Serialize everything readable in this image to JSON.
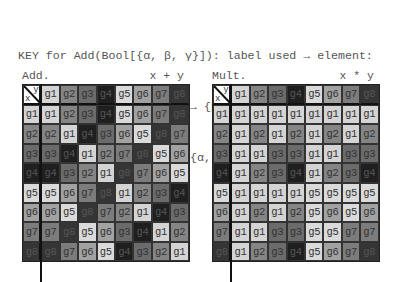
{
  "key": {
    "line1": "KEY for Add(Bool[{α, β, γ}]): label used → element:",
    "line2": "{g1 → {}, g2 → {γ}, g3 → {β}, g4 → {β, γ}, g5 →",
    "line3": "{α}, g6 → {α, γ}, g7 → {α, β}, g8 → {α, β, γ}}"
  },
  "labels": [
    "g1",
    "g2",
    "g3",
    "g4",
    "g5",
    "g6",
    "g7",
    "g8"
  ],
  "colors": {
    "g1": "#d4d4d4",
    "g2": "#858585",
    "g3": "#6b6b6b",
    "g4": "#1f1f1f",
    "g5": "#dadada",
    "g6": "#a2a2a2",
    "g7": "#7c7c7c",
    "g8": "#353535"
  },
  "corner": {
    "x": "x",
    "y": "y"
  },
  "tables": [
    {
      "title": "Add.",
      "op": "x + y",
      "rows": [
        [
          "g1",
          "g2",
          "g3",
          "g4",
          "g5",
          "g6",
          "g7",
          "g8"
        ],
        [
          "g2",
          "g1",
          "g4",
          "g3",
          "g6",
          "g5",
          "g8",
          "g7"
        ],
        [
          "g3",
          "g4",
          "g1",
          "g2",
          "g7",
          "g8",
          "g5",
          "g6"
        ],
        [
          "g4",
          "g3",
          "g2",
          "g1",
          "g8",
          "g7",
          "g6",
          "g5"
        ],
        [
          "g5",
          "g6",
          "g7",
          "g8",
          "g1",
          "g2",
          "g3",
          "g4"
        ],
        [
          "g6",
          "g5",
          "g8",
          "g7",
          "g2",
          "g1",
          "g4",
          "g3"
        ],
        [
          "g7",
          "g8",
          "g5",
          "g6",
          "g3",
          "g4",
          "g1",
          "g2"
        ],
        [
          "g8",
          "g7",
          "g6",
          "g5",
          "g4",
          "g3",
          "g2",
          "g1"
        ]
      ]
    },
    {
      "title": "Mult.",
      "op": "x * y",
      "rows": [
        [
          "g1",
          "g1",
          "g1",
          "g1",
          "g1",
          "g1",
          "g1",
          "g1"
        ],
        [
          "g1",
          "g2",
          "g1",
          "g2",
          "g1",
          "g2",
          "g1",
          "g2"
        ],
        [
          "g1",
          "g1",
          "g3",
          "g3",
          "g1",
          "g1",
          "g3",
          "g3"
        ],
        [
          "g1",
          "g2",
          "g3",
          "g4",
          "g1",
          "g2",
          "g3",
          "g4"
        ],
        [
          "g1",
          "g1",
          "g1",
          "g1",
          "g5",
          "g5",
          "g5",
          "g5"
        ],
        [
          "g1",
          "g2",
          "g1",
          "g2",
          "g5",
          "g6",
          "g5",
          "g6"
        ],
        [
          "g1",
          "g1",
          "g3",
          "g3",
          "g5",
          "g5",
          "g7",
          "g7"
        ],
        [
          "g1",
          "g2",
          "g3",
          "g4",
          "g5",
          "g6",
          "g7",
          "g8"
        ]
      ]
    }
  ]
}
